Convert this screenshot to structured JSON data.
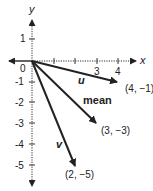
{
  "diagram": {
    "axes": {
      "x_label": "x",
      "y_label": "y",
      "origin_label": "0",
      "x_ticks": [
        {
          "value": 1,
          "label": ""
        },
        {
          "value": 2,
          "label": ""
        },
        {
          "value": 3,
          "label": "3"
        },
        {
          "value": 4,
          "label": "4"
        }
      ],
      "y_ticks": [
        {
          "value": 1,
          "label": "1"
        },
        {
          "value": -1,
          "label": "-1"
        },
        {
          "value": -2,
          "label": "-2"
        },
        {
          "value": -3,
          "label": "-3"
        },
        {
          "value": -4,
          "label": "-4"
        },
        {
          "value": -5,
          "label": "-5"
        }
      ]
    },
    "vectors": [
      {
        "name": "u",
        "to": [
          4,
          -1
        ],
        "point_label": "(4, −1)"
      },
      {
        "name": "mean",
        "to": [
          3,
          -3
        ],
        "point_label": "(3, −3)"
      },
      {
        "name": "v",
        "to": [
          2,
          -5
        ],
        "point_label": "(2, −5)"
      }
    ],
    "colors": {
      "ink": "#222222",
      "background": "#ffffff"
    }
  }
}
